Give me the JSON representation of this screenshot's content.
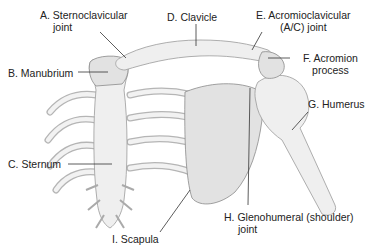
{
  "diagram": {
    "colors": {
      "bone": "#efefef",
      "outline": "#9a9a9a",
      "text": "#222222",
      "leader": "#333333"
    },
    "labels": {
      "a": {
        "line1": "A. Sternoclavicular",
        "line2": "joint"
      },
      "b": {
        "line1": "B. Manubrium"
      },
      "c": {
        "line1": "C. Sternum"
      },
      "d": {
        "line1": "D. Clavicle"
      },
      "e": {
        "line1": "E. Acromioclavicular",
        "line2": "(A/C) joint"
      },
      "f": {
        "line1": "F. Acromion",
        "line2": "process"
      },
      "g": {
        "line1": "G. Humerus"
      },
      "h": {
        "line1": "H. Glenohumeral (shoulder)",
        "line2": "joint"
      },
      "i": {
        "line1": "I. Scapula"
      }
    }
  }
}
